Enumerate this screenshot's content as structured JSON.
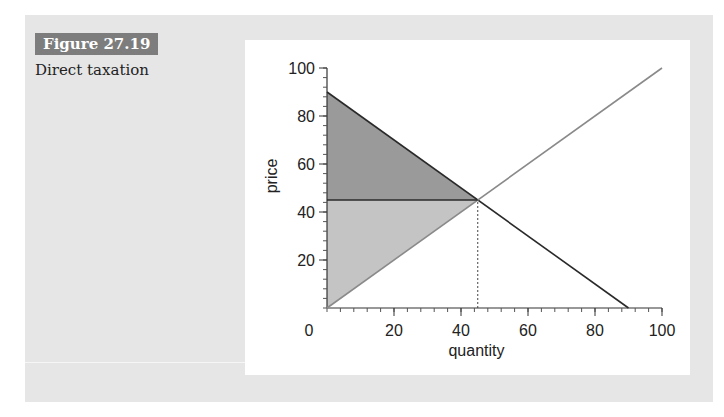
{
  "figure": {
    "label": "Figure 27.19",
    "title": "Direct taxation"
  },
  "colors": {
    "panel_bg": "#e6e6e6",
    "label_bg": "#7d7d7d",
    "upper_fill": "#9a9a9a",
    "lower_fill": "#c4c4c4",
    "demand_line": "#2a2a2a",
    "supply_line": "#8a8a8a"
  },
  "chart_data": {
    "type": "line",
    "title": "Direct taxation",
    "xlabel": "quantity",
    "ylabel": "price",
    "xlim": [
      0,
      100
    ],
    "ylim": [
      0,
      100
    ],
    "x_ticks": [
      0,
      20,
      40,
      60,
      80,
      100
    ],
    "y_ticks": [
      20,
      40,
      60,
      80,
      100
    ],
    "x_tick_labels": [
      "0",
      "20",
      "40",
      "60",
      "80",
      "100"
    ],
    "y_tick_labels": [
      "20",
      "40",
      "60",
      "80",
      "100"
    ],
    "grid": false,
    "legend": null,
    "series": [
      {
        "name": "demand",
        "x": [
          0,
          90
        ],
        "y": [
          90,
          0
        ],
        "style": "solid dark"
      },
      {
        "name": "supply",
        "x": [
          0,
          100
        ],
        "y": [
          0,
          100
        ],
        "style": "solid grey"
      },
      {
        "name": "price line",
        "x": [
          0,
          45
        ],
        "y": [
          45,
          45
        ],
        "style": "solid dark horizontal"
      },
      {
        "name": "equilibrium quantity marker",
        "x": [
          45,
          45
        ],
        "y": [
          0,
          45
        ],
        "style": "dotted vertical"
      }
    ],
    "shaded_regions": [
      {
        "name": "upper triangle (dark)",
        "vertices": [
          [
            0,
            90
          ],
          [
            45,
            45
          ],
          [
            0,
            45
          ]
        ]
      },
      {
        "name": "lower triangle (light)",
        "vertices": [
          [
            0,
            45
          ],
          [
            45,
            45
          ],
          [
            0,
            0
          ]
        ]
      }
    ],
    "equilibrium": {
      "quantity": 45,
      "price": 45
    }
  }
}
